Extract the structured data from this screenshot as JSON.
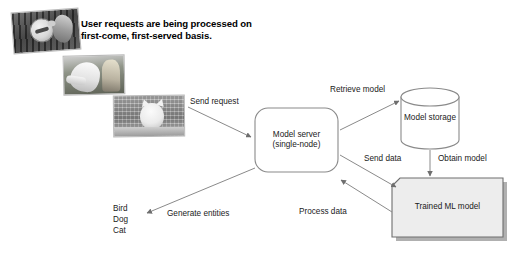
{
  "heading": {
    "line1": "User requests are being processed on",
    "line2": "first-come, first-served basis."
  },
  "photos": [
    {
      "name": "bird-photo",
      "alt": "Bird in cage"
    },
    {
      "name": "dog-photo",
      "alt": "Dog with person"
    },
    {
      "name": "cat-photo",
      "alt": "Cat on ledge"
    }
  ],
  "nodes": {
    "model_server": {
      "line1": "Model server",
      "line2": "(single-node)"
    },
    "model_storage": {
      "label": "Model storage"
    },
    "trained_model": {
      "label": "Trained ML model"
    }
  },
  "edges": {
    "send_request": "Send request",
    "retrieve_model": "Retrieve model",
    "obtain_model": "Obtain model",
    "send_data": "Send data",
    "process_data": "Process data",
    "generate_entities": "Generate entities"
  },
  "entities": [
    "Bird",
    "Dog",
    "Cat"
  ],
  "colors": {
    "background": "#ffffff",
    "stroke": "#8a8a8a",
    "text": "#1a1a1a",
    "node_fill": "#ffffff",
    "trained_model_fill": "#ededed",
    "shadow": "#b0b0b0"
  }
}
